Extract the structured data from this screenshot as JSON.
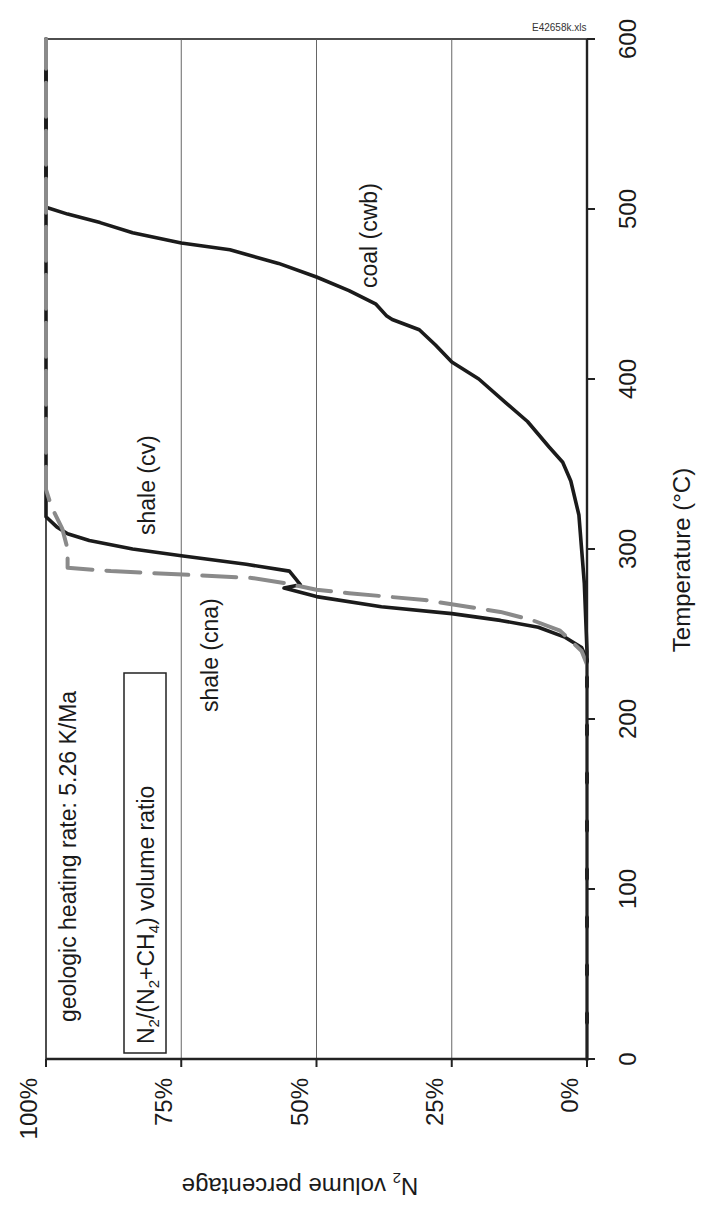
{
  "file_label": "E42658k.xls",
  "annotations": {
    "heating_rate": "geologic heating rate: 5.26 K/Ma",
    "ratio_box": "N2/(N2+CH4)  volume ratio",
    "ratio_box_parts": [
      "N",
      "2",
      "/(N",
      "2",
      "+CH",
      "4",
      ")  volume ratio"
    ]
  },
  "axes": {
    "x_title": "Temperature (°C)",
    "y_title_main": "N",
    "y_title_sub": "2",
    "y_title_rest": " volume percentage",
    "x_ticks": [
      "0",
      "100",
      "200",
      "300",
      "400",
      "500",
      "600"
    ],
    "y_ticks": [
      "0%",
      "25%",
      "50%",
      "75%",
      "100%"
    ]
  },
  "series_labels": {
    "coal": "coal (cwb)",
    "shale_cv": "shale (cv)",
    "shale_cna": "shale (cna)"
  },
  "chart_data": {
    "type": "line",
    "title": "",
    "orientation_note": "figure rotated 90° counterclockwise on page",
    "xlabel": "Temperature (°C)",
    "ylabel": "N2 volume percentage",
    "xlim": [
      0,
      600
    ],
    "ylim": [
      0,
      100
    ],
    "x_ticks": [
      0,
      100,
      200,
      300,
      400,
      500,
      600
    ],
    "y_ticks": [
      0,
      25,
      50,
      75,
      100
    ],
    "grid": {
      "y_major": true,
      "x_major": false
    },
    "annotations": [
      "geologic heating rate: 5.26 K/Ma",
      "N2/(N2+CH4) volume ratio",
      "E42658k.xls"
    ],
    "series": [
      {
        "name": "coal (cwb)",
        "style": "solid-black-thick",
        "x": [
          0,
          240,
          280,
          300,
          320,
          340,
          351,
          360,
          375,
          386,
          400,
          410,
          420,
          429,
          435,
          437,
          444,
          452,
          460,
          468,
          476,
          480,
          486,
          492,
          497,
          501,
          600
        ],
        "y": [
          0,
          0,
          0.5,
          1,
          1.5,
          3,
          4.5,
          7,
          11,
          15,
          20,
          25,
          28,
          31,
          36,
          37,
          39,
          44,
          50,
          57,
          66,
          75,
          84,
          90,
          96,
          100,
          100
        ]
      },
      {
        "name": "shale (cv)",
        "style": "solid-black-thick",
        "x": [
          0,
          235,
          242,
          248,
          254,
          258,
          262,
          266,
          272,
          277,
          279,
          283,
          287,
          291,
          296,
          300,
          305,
          309,
          313,
          319,
          600
        ],
        "y": [
          0,
          0,
          1,
          4,
          9,
          16,
          25,
          38,
          50,
          56,
          53,
          54,
          55,
          63,
          75,
          84,
          92,
          96,
          98,
          100,
          100
        ]
      },
      {
        "name": "shale (cna)",
        "style": "dashed-gray",
        "x": [
          0,
          232,
          240,
          246,
          252,
          258,
          263,
          270,
          274,
          276,
          280,
          283,
          287,
          289,
          300,
          312,
          325,
          335,
          600
        ],
        "y": [
          0,
          0,
          1,
          3,
          5,
          10,
          16,
          30,
          44,
          50,
          56,
          62,
          88,
          96,
          96,
          97,
          99,
          100,
          100
        ]
      }
    ]
  }
}
